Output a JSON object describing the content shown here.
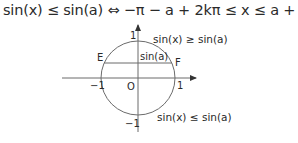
{
  "formula": {
    "text": "sin(x) ≤ sin(a) ⇔ −π − a + 2kπ ≤ x ≤ a + 2kπ, k ∈ ℤ"
  },
  "diagram": {
    "axis_labels": {
      "y_top": "1",
      "y_bottom": "−1",
      "x_left": "−1",
      "x_right": "1",
      "origin": "O"
    },
    "points": {
      "E": "E",
      "F": "F"
    },
    "chord_label": "sin(a)",
    "region_upper": "sin(x) ≥ sin(a)",
    "region_lower": "sin(x) ≤ sin(a)"
  },
  "colors": {
    "stroke": "#6b6b6b",
    "text": "#2a2a2a"
  }
}
